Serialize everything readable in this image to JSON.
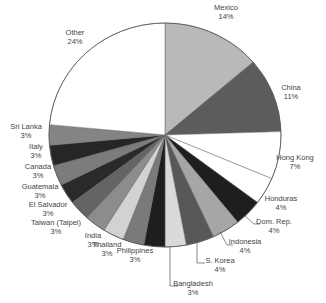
{
  "chart_data": {
    "type": "pie",
    "title": "",
    "start_angle_deg": 0,
    "direction": "clockwise",
    "center": [
      165,
      135
    ],
    "radius": [
      116,
      112
    ],
    "categories": [
      "Mexico",
      "China",
      "Hong Kong",
      "Honduras",
      "Dom. Rep.",
      "Indonesia",
      "S. Korea",
      "Bangladesh",
      "Philippines",
      "Thailand",
      "India",
      "Taiwan (Taipei)",
      "El Salvador",
      "Guatemala",
      "Canada",
      "Italy",
      "Sri Lanka",
      "Other"
    ],
    "values": [
      14,
      11,
      7,
      4,
      4,
      4,
      4,
      3,
      3,
      3,
      3,
      3,
      3,
      3,
      3,
      3,
      3,
      24
    ],
    "value_labels": [
      "14%",
      "11%",
      "7%",
      "4%",
      "4%",
      "4%",
      "4%",
      "3%",
      "3%",
      "3%",
      "3%",
      "3%",
      "3%",
      "3%",
      "3%",
      "3%",
      "3%",
      "24%"
    ],
    "colors": [
      "#b9b9b9",
      "#5c5c5c",
      "#ffffff",
      "#ffffff",
      "#1e1e1e",
      "#a6a6a6",
      "#585858",
      "#dadada",
      "#1e1e1e",
      "#7a7a7a",
      "#d2d2d2",
      "#8c8c8c",
      "#646464",
      "#2a2a2a",
      "#7c7c7c",
      "#262626",
      "#848484",
      "#ffffff"
    ],
    "legend": "none",
    "labels": [
      {
        "name": "Mexico",
        "pct": "14%",
        "x": 226,
        "y": 10,
        "anchor": "middle"
      },
      {
        "name": "China",
        "pct": "11%",
        "x": 291,
        "y": 90,
        "anchor": "middle"
      },
      {
        "name": "Hong Kong",
        "pct": "7%",
        "x": 295,
        "y": 160,
        "anchor": "middle"
      },
      {
        "name": "Honduras",
        "pct": "4%",
        "x": 281,
        "y": 201,
        "anchor": "middle"
      },
      {
        "name": "Dom. Rep.",
        "pct": "4%",
        "x": 274,
        "y": 224,
        "anchor": "middle"
      },
      {
        "name": "Indonesia",
        "pct": "4%",
        "x": 245,
        "y": 244,
        "anchor": "middle"
      },
      {
        "name": "S. Korea",
        "pct": "4%",
        "x": 220,
        "y": 263,
        "anchor": "middle"
      },
      {
        "name": "Bangladesh",
        "pct": "3%",
        "x": 193,
        "y": 286,
        "anchor": "middle"
      },
      {
        "name": "Philippines",
        "pct": "3%",
        "x": 135,
        "y": 253,
        "anchor": "middle"
      },
      {
        "name": "Thailand",
        "pct": "3%",
        "x": 107,
        "y": 247,
        "anchor": "middle"
      },
      {
        "name": "India",
        "pct": "3%",
        "x": 93,
        "y": 238,
        "anchor": "middle"
      },
      {
        "name": "Taiwan (Taipei)",
        "pct": "3%",
        "x": 56,
        "y": 225,
        "anchor": "middle"
      },
      {
        "name": "El Salvador",
        "pct": "3%",
        "x": 48,
        "y": 207,
        "anchor": "middle"
      },
      {
        "name": "Guatemala",
        "pct": "3%",
        "x": 40,
        "y": 189,
        "anchor": "middle"
      },
      {
        "name": "Canada",
        "pct": "3%",
        "x": 38,
        "y": 169,
        "anchor": "middle"
      },
      {
        "name": "Italy",
        "pct": "3%",
        "x": 36,
        "y": 149,
        "anchor": "middle"
      },
      {
        "name": "Sri Lanka",
        "pct": "3%",
        "x": 26,
        "y": 129,
        "anchor": "middle"
      },
      {
        "name": "Other",
        "pct": "24%",
        "x": 75,
        "y": 35,
        "anchor": "middle"
      }
    ],
    "leader_lines": [
      {
        "name": "Dom. Rep.",
        "points": [
          [
            245,
            216
          ],
          [
            254,
            224
          ],
          [
            260,
            224
          ]
        ]
      },
      {
        "name": "Indonesia",
        "points": [
          [
            220,
            232
          ],
          [
            227,
            245
          ],
          [
            233,
            245
          ]
        ]
      },
      {
        "name": "S. Korea",
        "points": [
          [
            197,
            240
          ],
          [
            197,
            263
          ],
          [
            205,
            263
          ]
        ]
      },
      {
        "name": "Bangladesh",
        "points": [
          [
            170,
            247
          ],
          [
            170,
            286
          ],
          [
            178,
            286
          ]
        ]
      }
    ]
  }
}
